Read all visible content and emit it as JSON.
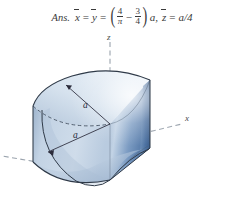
{
  "answer": {
    "tag": "Ans.",
    "var_x": "x",
    "var_y": "y",
    "var_z": "z",
    "equals": "=",
    "minus": "−",
    "frac1_num": "4",
    "frac1_den": "π",
    "frac2_num": "3",
    "frac2_den": "4",
    "paren_open": "(",
    "paren_close": ")",
    "after_paren": "a,",
    "z_value": "a/4",
    "full_text": "Ans. x̄ = ȳ = (4/π − 3/4)a, z̄ = a/4"
  },
  "figure": {
    "caption": "Quarter-cylinder solid cut by a curved surface, shown with z-axis vertical, x-axis to the lower right and y-axis to the lower left",
    "axes": {
      "z_label": "z",
      "x_label": "x",
      "y_label": ""
    },
    "dimensions": [
      {
        "label": "a",
        "role": "radius-upper"
      },
      {
        "label": "a",
        "role": "radius-lower"
      }
    ],
    "colors": {
      "body_light": "#ccd9e8",
      "body_mid": "#aabfd6",
      "body_shadow": "#8fa9c6",
      "face_dark": "#5a7fae",
      "face_dark_edge": "#40628f",
      "top_highlight": "#e4edf6",
      "outline": "#2f3a48",
      "axis_dash": "#9aa3ad"
    }
  }
}
